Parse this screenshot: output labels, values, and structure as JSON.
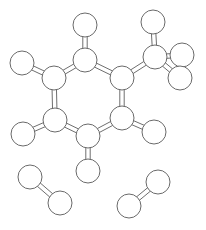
{
  "figure": {
    "background_color": "#ffffff",
    "atom_fill_color": "#ffffff",
    "atom_stroke_color": "#6a6a6a",
    "bond_stroke_color": "#6e6e6e",
    "bond_stroke_width": 1,
    "atom_stroke_width": 1,
    "canvas_width": 206,
    "canvas_height": 230
  },
  "chart_data": {
    "type": "diagram",
    "molecules": [
      {
        "name": "toluene",
        "label": "methylbenzene",
        "atom_count": 15,
        "bond_count": 15
      },
      {
        "name": "diatomic-lower-left",
        "label": "diatomic molecule",
        "atom_count": 2,
        "bond_count": 1
      },
      {
        "name": "diatomic-lower-right",
        "label": "diatomic molecule",
        "atom_count": 2,
        "bond_count": 1
      }
    ],
    "atoms": [
      {
        "id": "c1",
        "molecule": "toluene",
        "role": "ring-carbon",
        "cx": 85,
        "cy": 60,
        "r": 12
      },
      {
        "id": "c2",
        "molecule": "toluene",
        "role": "ring-carbon",
        "cx": 122,
        "cy": 78,
        "r": 12
      },
      {
        "id": "c3",
        "molecule": "toluene",
        "role": "ring-carbon",
        "cx": 122,
        "cy": 118,
        "r": 12
      },
      {
        "id": "c4",
        "molecule": "toluene",
        "role": "ring-carbon",
        "cx": 88,
        "cy": 136,
        "r": 12
      },
      {
        "id": "c5",
        "molecule": "toluene",
        "role": "ring-carbon",
        "cx": 55,
        "cy": 120,
        "r": 12
      },
      {
        "id": "c6",
        "molecule": "toluene",
        "role": "ring-carbon",
        "cx": 54,
        "cy": 78,
        "r": 12
      },
      {
        "id": "h1",
        "molecule": "toluene",
        "role": "hydrogen",
        "cx": 85,
        "cy": 25,
        "r": 12
      },
      {
        "id": "h6",
        "molecule": "toluene",
        "role": "hydrogen",
        "cx": 22,
        "cy": 63,
        "r": 12
      },
      {
        "id": "h5",
        "molecule": "toluene",
        "role": "hydrogen",
        "cx": 23,
        "cy": 134,
        "r": 12
      },
      {
        "id": "h4",
        "molecule": "toluene",
        "role": "hydrogen",
        "cx": 88,
        "cy": 171,
        "r": 12
      },
      {
        "id": "h3",
        "molecule": "toluene",
        "role": "hydrogen",
        "cx": 154,
        "cy": 132,
        "r": 12
      },
      {
        "id": "cm",
        "molecule": "toluene",
        "role": "methyl-carbon",
        "cx": 155,
        "cy": 57,
        "r": 12
      },
      {
        "id": "hm1",
        "molecule": "toluene",
        "role": "hydrogen",
        "cx": 153,
        "cy": 22,
        "r": 12
      },
      {
        "id": "hm2",
        "molecule": "toluene",
        "role": "hydrogen",
        "cx": 182,
        "cy": 55,
        "r": 12
      },
      {
        "id": "hm3",
        "molecule": "toluene",
        "role": "hydrogen",
        "cx": 180,
        "cy": 78,
        "r": 12
      },
      {
        "id": "dl1",
        "molecule": "diatomic-lower-left",
        "role": "atom",
        "cx": 30,
        "cy": 177,
        "r": 12
      },
      {
        "id": "dl2",
        "molecule": "diatomic-lower-left",
        "role": "atom",
        "cx": 60,
        "cy": 203,
        "r": 12
      },
      {
        "id": "dr1",
        "molecule": "diatomic-lower-right",
        "role": "atom",
        "cx": 129,
        "cy": 206,
        "r": 12
      },
      {
        "id": "dr2",
        "molecule": "diatomic-lower-right",
        "role": "atom",
        "cx": 158,
        "cy": 182,
        "r": 12
      }
    ],
    "bonds": [
      {
        "from": "c1",
        "to": "c2",
        "order": 1,
        "kind": "ring"
      },
      {
        "from": "c2",
        "to": "c3",
        "order": 2,
        "kind": "ring"
      },
      {
        "from": "c3",
        "to": "c4",
        "order": 1,
        "kind": "ring"
      },
      {
        "from": "c4",
        "to": "c5",
        "order": 2,
        "kind": "ring"
      },
      {
        "from": "c5",
        "to": "c6",
        "order": 2,
        "kind": "ring"
      },
      {
        "from": "c6",
        "to": "c1",
        "order": 1,
        "kind": "ring"
      },
      {
        "from": "c1",
        "to": "h1",
        "order": 1,
        "kind": "substituent"
      },
      {
        "from": "c6",
        "to": "h6",
        "order": 1,
        "kind": "substituent"
      },
      {
        "from": "c5",
        "to": "h5",
        "order": 1,
        "kind": "substituent"
      },
      {
        "from": "c4",
        "to": "h4",
        "order": 1,
        "kind": "substituent"
      },
      {
        "from": "c3",
        "to": "h3",
        "order": 1,
        "kind": "substituent"
      },
      {
        "from": "c2",
        "to": "cm",
        "order": 1,
        "kind": "substituent"
      },
      {
        "from": "cm",
        "to": "hm1",
        "order": 1,
        "kind": "substituent"
      },
      {
        "from": "cm",
        "to": "hm2",
        "order": 1,
        "kind": "substituent"
      },
      {
        "from": "cm",
        "to": "hm3",
        "order": 1,
        "kind": "substituent"
      },
      {
        "from": "dl1",
        "to": "dl2",
        "order": 2,
        "kind": "diatomic"
      },
      {
        "from": "dr1",
        "to": "dr2",
        "order": 2,
        "kind": "diatomic"
      }
    ],
    "double_bond_offset": 2.2,
    "legend": [],
    "annotations": []
  }
}
